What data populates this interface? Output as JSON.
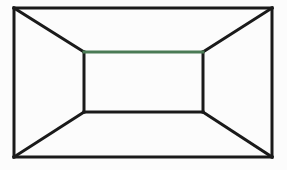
{
  "figure": {
    "background_color": "#fcfcfc",
    "line_color": "#1a1a1a",
    "accent_color": "#4a7a55",
    "line_width": 3,
    "canvas": {
      "width": 287,
      "height": 170
    },
    "outer_rect": {
      "name": "outer-frame",
      "left": 14,
      "top": 8,
      "right": 272,
      "bottom": 157,
      "color": "#1a1a1a"
    },
    "inner_rect": {
      "name": "back-wall",
      "left": 84,
      "top": 52,
      "right": 203,
      "bottom": 112,
      "color": "#1a1a1a"
    },
    "edges": [
      {
        "name": "outer-top-edge",
        "x1": 14,
        "y1": 8,
        "x2": 272,
        "y2": 8,
        "color": "#1a1a1a"
      },
      {
        "name": "outer-right-edge",
        "x1": 272,
        "y1": 8,
        "x2": 272,
        "y2": 157,
        "color": "#1a1a1a"
      },
      {
        "name": "outer-bottom-edge",
        "x1": 272,
        "y1": 157,
        "x2": 14,
        "y2": 157,
        "color": "#1a1a1a"
      },
      {
        "name": "outer-left-edge",
        "x1": 14,
        "y1": 157,
        "x2": 14,
        "y2": 8,
        "color": "#1a1a1a"
      },
      {
        "name": "inner-top-edge",
        "x1": 84,
        "y1": 52,
        "x2": 203,
        "y2": 52,
        "color": "#4a7a55"
      },
      {
        "name": "inner-right-edge",
        "x1": 203,
        "y1": 52,
        "x2": 203,
        "y2": 112,
        "color": "#1a1a1a"
      },
      {
        "name": "inner-bottom-edge",
        "x1": 203,
        "y1": 112,
        "x2": 84,
        "y2": 112,
        "color": "#1a1a1a"
      },
      {
        "name": "inner-left-edge",
        "x1": 84,
        "y1": 112,
        "x2": 84,
        "y2": 52,
        "color": "#1a1a1a"
      },
      {
        "name": "diagonal-top-left",
        "x1": 14,
        "y1": 8,
        "x2": 84,
        "y2": 52,
        "color": "#1a1a1a"
      },
      {
        "name": "diagonal-top-right",
        "x1": 272,
        "y1": 8,
        "x2": 203,
        "y2": 52,
        "color": "#1a1a1a"
      },
      {
        "name": "diagonal-bottom-right",
        "x1": 272,
        "y1": 157,
        "x2": 203,
        "y2": 112,
        "color": "#1a1a1a"
      },
      {
        "name": "diagonal-bottom-left",
        "x1": 14,
        "y1": 157,
        "x2": 84,
        "y2": 112,
        "color": "#1a1a1a"
      }
    ]
  }
}
